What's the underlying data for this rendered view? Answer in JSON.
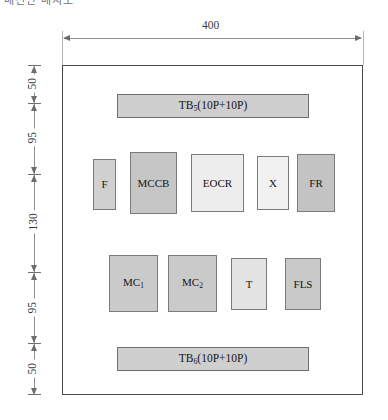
{
  "diagram": {
    "clipped_top_text": "배전반 배치도",
    "enclosure": {
      "name": "control-panel-enclosure"
    },
    "dimensions": {
      "width": {
        "value": "400",
        "orientation": "horizontal"
      },
      "vertical": [
        {
          "value": "50"
        },
        {
          "value": "95"
        },
        {
          "value": "130"
        },
        {
          "value": "95"
        },
        {
          "value": "50"
        }
      ]
    },
    "terminal_blocks": [
      {
        "id": "tb5",
        "prefix": "TB",
        "subscript": "5",
        "suffix": "(10P+10P)",
        "fill": "#cfcfcf"
      },
      {
        "id": "tb6",
        "prefix": "TB",
        "subscript": "6",
        "suffix": "(10P+10P)",
        "fill": "#cfcfcf"
      }
    ],
    "component_rows": [
      {
        "row": "upper",
        "components": [
          {
            "id": "f",
            "label": "F",
            "fill": "#d0d0d0"
          },
          {
            "id": "mccb",
            "label": "MCCB",
            "fill": "#c6c6c6"
          },
          {
            "id": "eocr",
            "label": "EOCR",
            "fill": "#ededed"
          },
          {
            "id": "x",
            "label": "X",
            "fill": "#f1f1f1"
          },
          {
            "id": "fr",
            "label": "FR",
            "fill": "#c3c3c3"
          }
        ]
      },
      {
        "row": "lower",
        "components": [
          {
            "id": "mc1",
            "prefix": "MC",
            "subscript": "1",
            "fill": "#cacaca"
          },
          {
            "id": "mc2",
            "prefix": "MC",
            "subscript": "2",
            "fill": "#cacaca"
          },
          {
            "id": "t",
            "label": "T",
            "fill": "#e3e3e3"
          },
          {
            "id": "fls",
            "label": "FLS",
            "fill": "#c9c9c9"
          }
        ]
      }
    ]
  }
}
